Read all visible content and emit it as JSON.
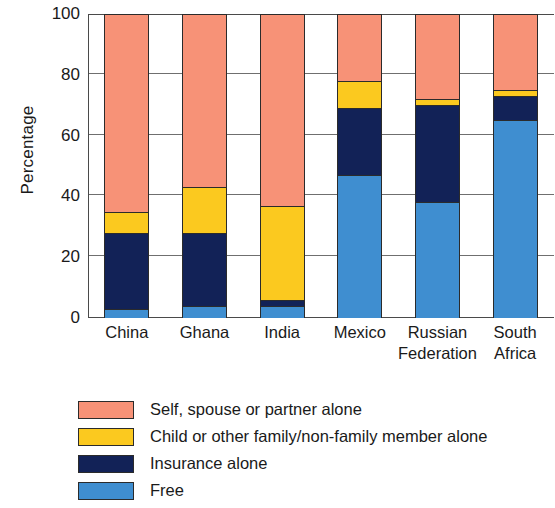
{
  "chart_data": {
    "type": "bar",
    "subtype": "stacked-bar-100",
    "title": "",
    "xlabel": "",
    "ylabel": "Percentage",
    "ylim": [
      0,
      100
    ],
    "yticks": [
      0,
      20,
      40,
      60,
      80,
      100
    ],
    "ytick_labels": [
      "0",
      "20",
      "40",
      "60",
      "80",
      "100"
    ],
    "grid": true,
    "grid_axis": "y",
    "legend_position": "below-left",
    "categories": [
      "China",
      "Ghana",
      "India",
      "Mexico",
      "Russian Federation",
      "South Africa"
    ],
    "category_lines": [
      [
        "China"
      ],
      [
        "Ghana"
      ],
      [
        "India"
      ],
      [
        "Mexico"
      ],
      [
        "Russian",
        "Federation"
      ],
      [
        "South",
        "Africa"
      ]
    ],
    "stack_order_bottom_to_top": [
      "Free",
      "Insurance alone",
      "Child or other family/non-family member alone",
      "Self, spouse or partner alone"
    ],
    "series": [
      {
        "name": "Free",
        "color": "#3f8ed0",
        "values": [
          3,
          4,
          4,
          47,
          38,
          65
        ]
      },
      {
        "name": "Insurance alone",
        "color": "#122257",
        "values": [
          25,
          24,
          2,
          22,
          32,
          8
        ]
      },
      {
        "name": "Child or other family/non-family member alone",
        "color": "#fbc91f",
        "values": [
          7,
          15,
          31,
          9,
          2,
          2
        ]
      },
      {
        "name": "Self, spouse or partner alone",
        "color": "#f79277",
        "values": [
          65,
          57,
          63,
          22,
          28,
          25
        ]
      }
    ],
    "cumulative_tops": {
      "Free": [
        3,
        4,
        4,
        47,
        38,
        65
      ],
      "Insurance alone": [
        28,
        28,
        6,
        69,
        70,
        73
      ],
      "Child or other family/non-family member alone": [
        35,
        43,
        37,
        78,
        72,
        75
      ],
      "Self, spouse or partner alone": [
        100,
        100,
        100,
        100,
        100,
        100
      ]
    }
  },
  "legend": {
    "items": [
      {
        "label": "Self, spouse or partner alone",
        "color": "#f79277"
      },
      {
        "label": "Child or other family/non-family member alone",
        "color": "#fbc91f"
      },
      {
        "label": "Insurance alone",
        "color": "#122257"
      },
      {
        "label": "Free",
        "color": "#3f8ed0"
      }
    ]
  },
  "axis": {
    "y_title": "Percentage"
  },
  "colors": {
    "self_spouse_partner": "#f79277",
    "child_other_family": "#fbc91f",
    "insurance": "#122257",
    "free": "#3f8ed0",
    "axis_line": "#4a4a4a",
    "gridline": "#6f6f6f",
    "bar_outline": "#2b2b2b",
    "text": "#1a1a1a",
    "background": "#ffffff"
  }
}
